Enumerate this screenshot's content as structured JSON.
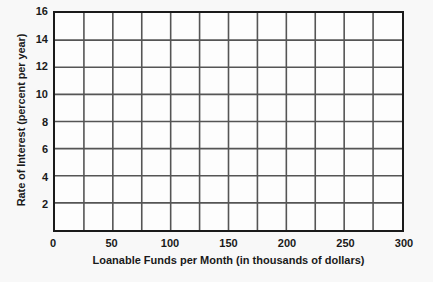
{
  "chart_data": {
    "type": "line",
    "title": "",
    "subtitle": "",
    "xlabel": "Loanable Funds per Month (in thousands of dollars)",
    "ylabel": "Rate of Interest (percent per year)",
    "xlim": [
      0,
      300
    ],
    "ylim": [
      0,
      16
    ],
    "x_tick_labels": [
      "0",
      "50",
      "100",
      "150",
      "200",
      "250",
      "300"
    ],
    "x_tick_values": [
      0,
      50,
      100,
      150,
      200,
      250,
      300
    ],
    "y_tick_labels": [
      "2",
      "4",
      "6",
      "8",
      "10",
      "12",
      "14",
      "16"
    ],
    "y_tick_values": [
      2,
      4,
      6,
      8,
      10,
      12,
      14,
      16
    ],
    "x_gridline_values": [
      0,
      25,
      50,
      75,
      100,
      125,
      150,
      175,
      200,
      225,
      250,
      275,
      300
    ],
    "y_gridline_values": [
      2,
      4,
      6,
      8,
      10,
      12,
      14,
      16
    ],
    "grid": true,
    "legend": null,
    "legend_position": "none",
    "series": [],
    "annotations": [],
    "note": "Empty coordinate grid with no plotted data series"
  },
  "style": {
    "background_color": "#f8f8f8",
    "plot_background_color": "#fdfdfd",
    "grid_color": "#555555",
    "axis_frame_color": "#1a1a1a",
    "text_color": "#1a1a1a"
  }
}
